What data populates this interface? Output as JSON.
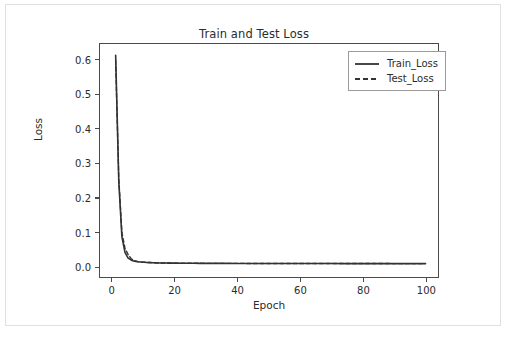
{
  "figure": {
    "background_color": "#ffffff",
    "border_color": "#e0e0e0"
  },
  "chart_data": {
    "type": "line",
    "title": "Train and Test Loss",
    "xlabel": "Epoch",
    "ylabel": "Loss",
    "xlim": [
      -4,
      104
    ],
    "ylim": [
      -0.031,
      0.648
    ],
    "grid": false,
    "legend_position": "upper right",
    "xticks": [
      0,
      20,
      40,
      60,
      80,
      100
    ],
    "xtick_labels": [
      "0",
      "20",
      "40",
      "60",
      "80",
      "100"
    ],
    "yticks": [
      0.0,
      0.1,
      0.2,
      0.3,
      0.4,
      0.5,
      0.6
    ],
    "ytick_labels": [
      "0.0",
      "0.1",
      "0.2",
      "0.3",
      "0.4",
      "0.5",
      "0.6"
    ],
    "x": [
      1,
      2,
      3,
      4,
      5,
      6,
      7,
      8,
      9,
      10,
      11,
      12,
      13,
      14,
      15,
      16,
      17,
      18,
      19,
      20,
      22,
      24,
      26,
      28,
      30,
      35,
      40,
      45,
      50,
      55,
      60,
      65,
      70,
      75,
      80,
      85,
      90,
      95,
      100
    ],
    "series": [
      {
        "name": "Train_Loss",
        "color": "#333333",
        "linestyle": "solid",
        "linewidth": 1.6,
        "values": [
          0.615,
          0.248,
          0.086,
          0.04,
          0.024,
          0.018,
          0.015,
          0.0135,
          0.0125,
          0.0118,
          0.0112,
          0.0108,
          0.0105,
          0.0102,
          0.01,
          0.0098,
          0.0096,
          0.0095,
          0.0094,
          0.0093,
          0.0091,
          0.009,
          0.0089,
          0.0088,
          0.0087,
          0.0086,
          0.0085,
          0.0084,
          0.0084,
          0.0083,
          0.0083,
          0.0082,
          0.0082,
          0.0081,
          0.0081,
          0.0081,
          0.008,
          0.008,
          0.008
        ]
      },
      {
        "name": "Test_Loss",
        "color": "#333333",
        "linestyle": "dashed",
        "linewidth": 1.4,
        "values": [
          0.6,
          0.255,
          0.098,
          0.052,
          0.034,
          0.022,
          0.0165,
          0.0142,
          0.013,
          0.0122,
          0.0116,
          0.0111,
          0.0107,
          0.0104,
          0.0101,
          0.0099,
          0.0097,
          0.0096,
          0.0095,
          0.0094,
          0.0092,
          0.0091,
          0.009,
          0.0089,
          0.0088,
          0.0087,
          0.0086,
          0.0085,
          0.0085,
          0.0084,
          0.0084,
          0.0083,
          0.0083,
          0.0082,
          0.0082,
          0.0082,
          0.0081,
          0.0081,
          0.0081
        ]
      }
    ]
  }
}
